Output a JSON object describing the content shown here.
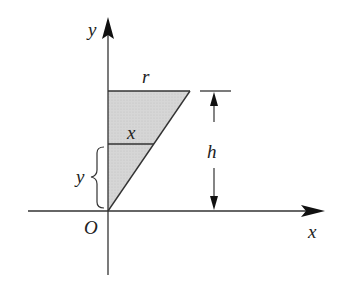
{
  "diagram": {
    "labels": {
      "y_axis": "y",
      "x_axis": "x",
      "origin": "O",
      "radius": "r",
      "slice_radius": "x",
      "height": "h",
      "slice_height": "y"
    },
    "colors": {
      "line": "#333333",
      "fill": "#d3d3d3"
    },
    "geometry": {
      "origin": [
        108,
        211
      ],
      "apex_top_right": [
        190,
        91
      ],
      "top_left": [
        108,
        91
      ],
      "slice_y_px": 144,
      "slice_x_end_px": 153
    }
  }
}
